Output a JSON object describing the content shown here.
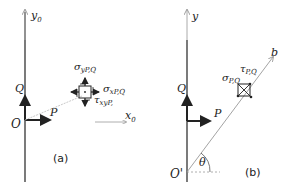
{
  "panel_a": {
    "caption": "(a)",
    "axis_y": "y",
    "axis_y_sub": "0",
    "axis_x": "x",
    "axis_x_sub": "0",
    "origin": "O",
    "vector_p": "P",
    "vector_q": "Q",
    "sigma_y": "σ",
    "sigma_y_sub": "yP,Q",
    "sigma_x": "σ",
    "sigma_x_sub": "xP,Q",
    "tau_xy": "τ",
    "tau_xy_sub": "xyP,"
  },
  "panel_b": {
    "caption": "(b)",
    "axis_y": "y",
    "axis_b": "b",
    "origin": "O'",
    "angle": "θ",
    "vector_p": "P",
    "vector_q": "Q",
    "sigma": "σ",
    "sigma_sub": "P,Q",
    "tau": "τ",
    "tau_sub": "P,Q"
  },
  "colors": {
    "line": "#222222",
    "light": "#999999"
  }
}
